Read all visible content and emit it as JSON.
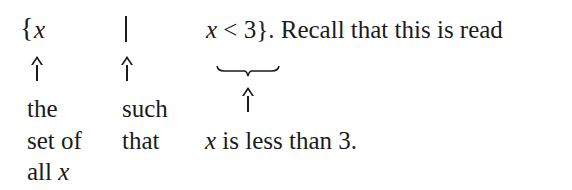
{
  "expression": {
    "open_brace": "{",
    "variable": "x",
    "separator": "|",
    "condition_var": "x",
    "condition_rest": " < 3}",
    "trailing_text": ". Recall that this is read"
  },
  "annotations": {
    "col1": {
      "line1": "the",
      "line2": "set of",
      "line3_text": "all ",
      "line3_var": "x"
    },
    "col2": {
      "line1": "such",
      "line2": "that"
    },
    "col3": {
      "var": "x",
      "text": " is less than 3."
    }
  }
}
